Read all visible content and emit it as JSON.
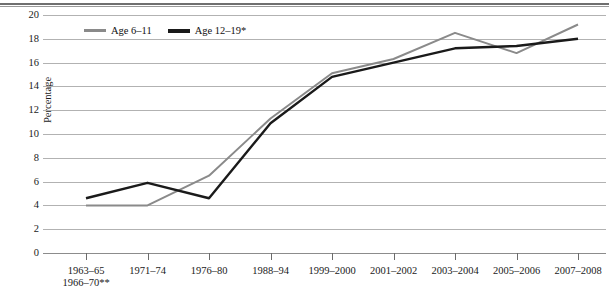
{
  "figure": {
    "top_rule": true,
    "y_axis_title": "Percentage"
  },
  "legend": {
    "position": "top-left-inside",
    "items": [
      {
        "label": "Age 6–11",
        "color": "#8a8a8a",
        "name": "legend-age-6-11"
      },
      {
        "label": "Age 12–19*",
        "color": "#1a1a1a",
        "name": "legend-age-12-19"
      }
    ]
  },
  "y_ticks": [
    "20",
    "18",
    "16",
    "14",
    "12",
    "10",
    "8",
    "6",
    "4",
    "2",
    "0"
  ],
  "x_ticks": [
    {
      "line1": "1963–65",
      "line2": "1966–70**"
    },
    {
      "line1": "1971–74",
      "line2": ""
    },
    {
      "line1": "1976–80",
      "line2": ""
    },
    {
      "line1": "1988–94",
      "line2": ""
    },
    {
      "line1": "1999–2000",
      "line2": ""
    },
    {
      "line1": "2001–2002",
      "line2": ""
    },
    {
      "line1": "2003–2004",
      "line2": ""
    },
    {
      "line1": "2005–2006",
      "line2": ""
    },
    {
      "line1": "2007–2008",
      "line2": ""
    }
  ],
  "chart_data": {
    "type": "line",
    "title": "",
    "subtitle": "",
    "xlabel": "",
    "ylabel": "Percentage",
    "ylim": [
      0,
      20
    ],
    "ytick_step": 2,
    "grid": true,
    "legend_position": "upper left (inside plot)",
    "categories": [
      "1963–65 1966–70**",
      "1971–74",
      "1976–80",
      "1988–94",
      "1999–2000",
      "2001–2002",
      "2003–2004",
      "2005–2006",
      "2007–2008"
    ],
    "series": [
      {
        "name": "Age 6–11",
        "color": "#8a8a8a",
        "values": [
          4.0,
          4.0,
          6.5,
          11.3,
          15.1,
          16.3,
          18.5,
          16.8,
          19.2
        ]
      },
      {
        "name": "Age 12–19*",
        "color": "#1a1a1a",
        "values": [
          4.6,
          5.9,
          4.6,
          10.9,
          14.8,
          16.0,
          17.2,
          17.4,
          18.0
        ]
      }
    ],
    "annotations": [
      "* footnote marker on Age 12–19 series label",
      "** footnote marker on 1966–70 x-axis label"
    ]
  }
}
